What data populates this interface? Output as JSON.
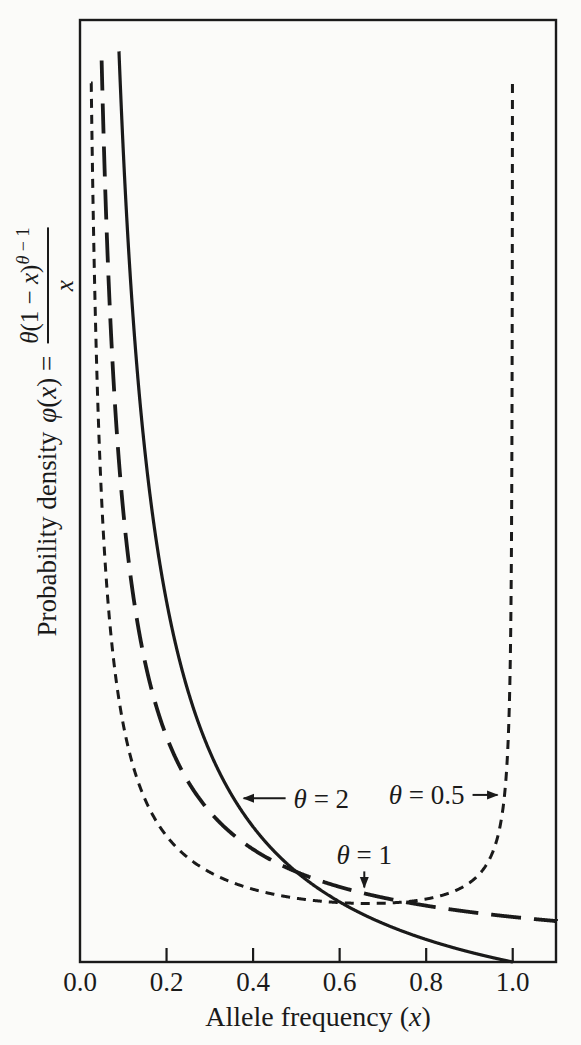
{
  "figure": {
    "background": "#fbfbf9",
    "ink": "#1a1a1a"
  },
  "chart_data": {
    "type": "line",
    "title": "",
    "xlabel_parts": {
      "text": "Allele frequency",
      "var": "(x)"
    },
    "ylabel_parts": {
      "prefix": "Probability density",
      "func": "φ(x) =",
      "numerator_base": "θ(1 − x)",
      "numerator_exponent": "θ − 1",
      "denominator": "x"
    },
    "formula": "phi(x) = theta * (1 - x)^(theta - 1) / x",
    "xlim": [
      0,
      1.1
    ],
    "ylim": [
      0,
      20.9
    ],
    "x_ticks": [
      "0.0",
      "0.2",
      "0.4",
      "0.6",
      "0.8",
      "1.0"
    ],
    "x_tick_values": [
      0,
      0.2,
      0.4,
      0.6,
      0.8,
      1.0
    ],
    "y_axis_tick_labels": "none",
    "legend": "none",
    "grid": false,
    "series": [
      {
        "name": "θ = 2",
        "theta": 2,
        "line_style": "solid",
        "x_start": 0.09009,
        "x_end": 1.0,
        "phi_clip": 20.2
      },
      {
        "name": "θ = 1",
        "theta": 1,
        "line_style": "long-dash",
        "x_start": 0.05,
        "x_end": 1.1,
        "phi_clip": 20.0
      },
      {
        "name": "θ = 0.5",
        "theta": 0.5,
        "line_style": "short-dash",
        "x_start": 0.02545,
        "x_end": 0.9993425,
        "phi_clip": 19.5
      }
    ],
    "annotations": [
      {
        "label": "θ = 2",
        "series_theta": 2,
        "target_x": 0.355,
        "arrow": "left"
      },
      {
        "label": "θ = 0.5",
        "series_theta": 0.5,
        "target_x": 0.9811,
        "arrow": "right"
      },
      {
        "label": "θ = 1",
        "series_theta": 1,
        "target_x": 0.657,
        "arrow": "down"
      }
    ],
    "key_points": [
      {
        "description": "curves theta=2 and theta=1 cross",
        "x": 0.5,
        "phi": 2.0
      },
      {
        "description": "curves theta=2 and theta=0.5 cross",
        "x": 0.603,
        "phi": 1.32
      },
      {
        "description": "curves theta=1 and theta=0.5 cross",
        "x": 0.75,
        "phi": 1.33
      },
      {
        "description": "minimum of theta=0.5 curve",
        "x": 0.667,
        "phi": 1.3
      },
      {
        "description": "theta=2 curve reaches zero",
        "x": 1.0,
        "phi": 0.0
      }
    ]
  }
}
